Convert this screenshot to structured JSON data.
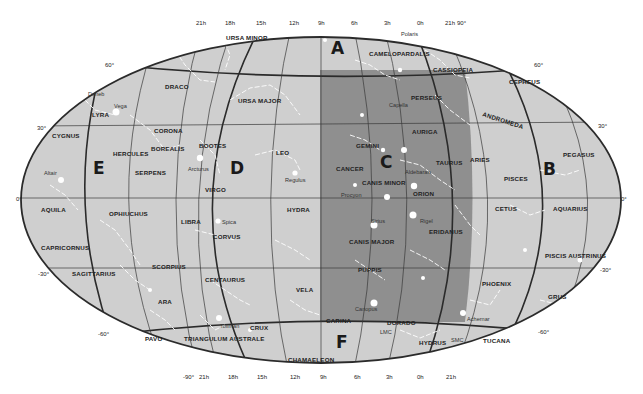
{
  "map": {
    "title": "Whole-sky map of constellations",
    "projection": "Aitoff / elliptical",
    "colors": {
      "background": "#ffffff",
      "sky_light": "#cfcfcf",
      "sky_dark": "#8f8f8f",
      "outline": "#2b2b2b",
      "stars": "#ffffff"
    },
    "regions": [
      {
        "id": "A",
        "label": "A"
      },
      {
        "id": "B",
        "label": "B"
      },
      {
        "id": "C",
        "label": "C"
      },
      {
        "id": "D",
        "label": "D"
      },
      {
        "id": "E",
        "label": "E"
      },
      {
        "id": "F",
        "label": "F"
      }
    ],
    "top_ra_labels": [
      "21h",
      "18h",
      "15h",
      "12h",
      "9h",
      "6h",
      "3h",
      "0h",
      "21h"
    ],
    "bottom_ra_labels": [
      "21h",
      "18h",
      "15h",
      "12h",
      "9h",
      "6h",
      "3h",
      "0h",
      "21h"
    ],
    "dec_labels": {
      "top_pole": "90°",
      "bottom_pole": "-90°",
      "left": [
        "60°",
        "30°",
        "0°",
        "-30°",
        "-60°"
      ],
      "right": [
        "60°",
        "30°",
        "0°",
        "-30°",
        "-60°"
      ]
    },
    "constellations": [
      "URSA MINOR",
      "CAMELOPARDALIS",
      "CASSIOPEIA",
      "CEPHEUS",
      "DRACO",
      "URSA MAJOR",
      "PERSEUS",
      "ANDROMEDA",
      "LYRA",
      "CYGNUS",
      "CORONA",
      "BOREALIS",
      "HERCULES",
      "BOOTES",
      "LEO",
      "GEMINI",
      "AURIGA",
      "CANCER",
      "TAURUS",
      "ARIES",
      "PEGASUS",
      "PISCES",
      "SERPENS",
      "VIRGO",
      "CANIS MINOR",
      "ORION",
      "AQUILA",
      "OPHIUCHUS",
      "LIBRA",
      "HYDRA",
      "CETUS",
      "AQUARIUS",
      "CORVUS",
      "CANIS MAJOR",
      "ERIDANUS",
      "CAPRICORNUS",
      "SAGITTARIUS",
      "SCORPIUS",
      "CENTAURUS",
      "PUPPIS",
      "PISCIS AUSTRINUS",
      "PHOENIX",
      "GRUS",
      "VELA",
      "ARA",
      "PAVO",
      "TRIANGULUM AUSTRALE",
      "CRUX",
      "CARINA",
      "DORADO",
      "HYDRUS",
      "TUCANA",
      "CHAMAELEON"
    ],
    "named_objects": [
      "Polaris",
      "Deneb",
      "Vega",
      "Capella",
      "Arcturus",
      "Regulus",
      "Aldebaran",
      "Altair",
      "Procyon",
      "Spica",
      "Sirius",
      "Rigel",
      "Canopus",
      "Toliman",
      "Achernar",
      "LMC",
      "SMC"
    ]
  }
}
